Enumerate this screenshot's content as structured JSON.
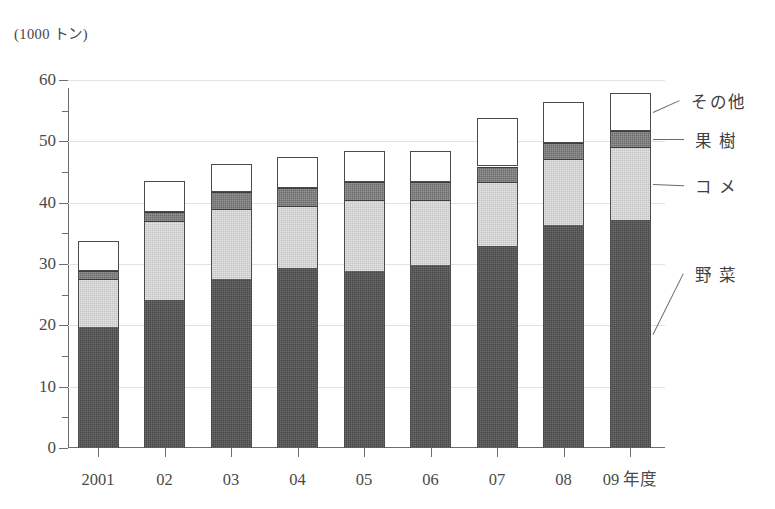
{
  "chart_data": {
    "type": "bar",
    "subtype": "stacked-bar",
    "title": "",
    "unit_label": "(1000 トン)",
    "xlabel": "年度",
    "ylabel": "",
    "ylim": [
      0,
      60
    ],
    "ytick_step": 10,
    "yminor_step": 5,
    "grid": true,
    "legend_position": "right-callout",
    "categories": [
      "2001",
      "02",
      "03",
      "04",
      "05",
      "06",
      "07",
      "08",
      "09 年度"
    ],
    "series": [
      {
        "name": "野菜",
        "values": [
          19.7,
          24.2,
          27.5,
          29.3,
          28.8,
          29.8,
          33.0,
          36.4,
          37.1
        ]
      },
      {
        "name": "コメ",
        "values": [
          7.8,
          12.8,
          11.4,
          10.2,
          11.7,
          10.7,
          10.3,
          10.8,
          12.0
        ]
      },
      {
        "name": "果樹",
        "values": [
          1.4,
          1.5,
          2.8,
          2.9,
          2.8,
          2.9,
          2.6,
          2.6,
          2.6
        ]
      },
      {
        "name": "その他",
        "values": [
          4.9,
          5.0,
          4.6,
          5.0,
          5.1,
          5.0,
          7.9,
          6.6,
          6.2
        ]
      }
    ],
    "totals": [
      33.8,
      43.5,
      46.3,
      47.4,
      48.4,
      48.4,
      53.8,
      56.4,
      57.9
    ],
    "ytick_labels": [
      "0",
      "10",
      "20",
      "30",
      "40",
      "50",
      "60"
    ],
    "colors": {
      "vegetable": "#474747",
      "rice": "#c3c3c3",
      "fruit": "#6c6c6c",
      "other": "#ffffff",
      "axis": "#6e6e6e",
      "grid": "#e2e2e2",
      "text": "#3f3f3f"
    }
  },
  "legend": {
    "items": [
      {
        "label": "その他"
      },
      {
        "label": "果 樹"
      },
      {
        "label": "コ メ"
      },
      {
        "label": "野 菜"
      }
    ]
  }
}
